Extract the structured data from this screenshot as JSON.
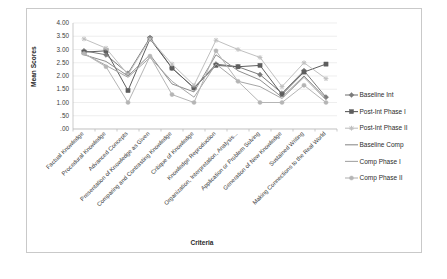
{
  "chart_data": {
    "type": "line",
    "title": "",
    "xlabel": "Criteria",
    "ylabel": "Mean Scores",
    "ylim": [
      0,
      4
    ],
    "ytick_labels": [
      "4.00",
      "3.50",
      "3.00",
      "2.50",
      "2.00",
      "1.50",
      "1.00",
      ".50",
      ".00"
    ],
    "ytick_values": [
      4,
      3.5,
      3,
      2.5,
      2,
      1.5,
      1,
      0.5,
      0
    ],
    "grid": true,
    "legend_position": "right",
    "categories": [
      "Factual Knowledge",
      "Procedural Knowledge",
      "Advanced Concepts",
      "Presentation of Knowledge as Given",
      "Comparing and Contrasting Knowledge",
      "Critique of Knowledge",
      "Knowledge Reproduction",
      "Organization, Interpretation, Analysis...",
      "Application or Problem Solving",
      "Generation of New Knowledge",
      "Sustained Writing",
      "Making Connections to the Real World"
    ],
    "series": [
      {
        "name": "Baseline Int",
        "color": "#7b7b7b",
        "marker": "diamond",
        "values": [
          2.95,
          2.8,
          2.1,
          3.45,
          2.3,
          1.55,
          2.45,
          2.35,
          2.05,
          1.35,
          2.2,
          1.2
        ]
      },
      {
        "name": "Post-Int Phase I",
        "color": "#5e5e5e",
        "marker": "square",
        "values": [
          2.9,
          2.95,
          1.45,
          3.4,
          2.3,
          1.55,
          2.4,
          2.35,
          2.4,
          1.3,
          2.15,
          2.45
        ]
      },
      {
        "name": "Post-Int Phase II",
        "color": "#c0c0c0",
        "marker": "star",
        "values": [
          3.4,
          3.05,
          2.05,
          3.4,
          2.45,
          1.65,
          3.35,
          3.0,
          2.7,
          1.6,
          2.5,
          1.9
        ]
      },
      {
        "name": "Baseline Comp",
        "color": "#8e8e8e",
        "marker": "none",
        "values": [
          2.8,
          2.55,
          2.0,
          2.8,
          1.7,
          1.4,
          2.8,
          2.2,
          1.85,
          1.2,
          2.0,
          1.15
        ]
      },
      {
        "name": "Comp Phase I",
        "color": "#a6a6a6",
        "marker": "none",
        "values": [
          2.85,
          2.4,
          1.95,
          2.7,
          1.8,
          1.2,
          2.45,
          1.8,
          1.6,
          1.15,
          1.95,
          1.1
        ]
      },
      {
        "name": "Comp Phase II",
        "color": "#b5b5b5",
        "marker": "circle",
        "values": [
          2.85,
          2.35,
          1.0,
          2.75,
          1.3,
          1.0,
          2.95,
          1.8,
          1.0,
          1.0,
          1.65,
          1.0
        ]
      }
    ]
  },
  "legend": {
    "items": [
      {
        "label": "Baseline Int"
      },
      {
        "label": "Post-Int Phase I"
      },
      {
        "label": "Post-Int Phase II"
      },
      {
        "label": "Baseline Comp"
      },
      {
        "label": "Comp Phase I"
      },
      {
        "label": "Comp Phase II"
      }
    ]
  }
}
